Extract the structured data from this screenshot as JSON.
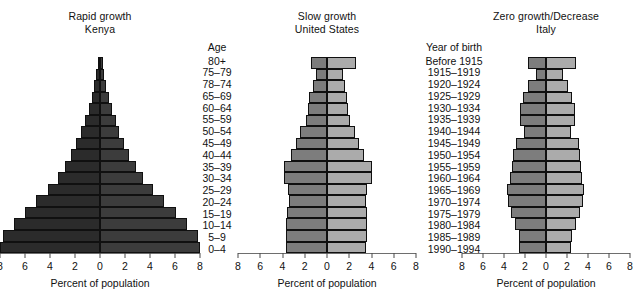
{
  "figure": {
    "axis_ticks": [
      "8",
      "6",
      "4",
      "2",
      "0",
      "2",
      "4",
      "6",
      "8"
    ],
    "axis_title": "Percent of population",
    "age_header": "Age",
    "yob_header": "Year of birth",
    "age_groups": [
      "80+",
      "75–79",
      "78–74",
      "65–69",
      "60–64",
      "55–59",
      "50–54",
      "45–49",
      "40–44",
      "35–39",
      "30–34",
      "25–29",
      "20–24",
      "15–19",
      "10–14",
      "5–9",
      "0–4"
    ],
    "years_of_birth": [
      "Before 1915",
      "1915–1919",
      "1920–1924",
      "1925–1929",
      "1930–1934",
      "1935–1939",
      "1940–1944",
      "1945–1949",
      "1950–1954",
      "1955–1959",
      "1960–1964",
      "1965–1969",
      "1970–1974",
      "1975–1979",
      "1980–1984",
      "1985–1989",
      "1990–1994"
    ],
    "colors": {
      "kenya_male": "#2b2b2b",
      "kenya_female": "#3c3c3c",
      "gray_male": "#7d7d7d",
      "gray_female": "#ababab",
      "outline": "#101010",
      "axis": "#6e6e6e",
      "text": "#111111",
      "background": "#ffffff"
    }
  },
  "chart_data": [
    {
      "id": "kenya",
      "type": "bar",
      "orientation": "population-pyramid",
      "title": "Rapid growth",
      "subtitle": "Kenya",
      "xlabel": "Percent of population",
      "ylabel": "Age",
      "xlim": [
        -8,
        8
      ],
      "xticks": [
        -8,
        -6,
        -4,
        -2,
        0,
        2,
        4,
        6,
        8
      ],
      "xticklabels": [
        "8",
        "6",
        "4",
        "2",
        "0",
        "2",
        "4",
        "6",
        "8"
      ],
      "grid": false,
      "legend": "none",
      "categories": [
        "80+",
        "75–79",
        "78–74",
        "65–69",
        "60–64",
        "55–59",
        "50–54",
        "45–49",
        "40–44",
        "35–39",
        "30–34",
        "25–29",
        "20–24",
        "15–19",
        "10–14",
        "5–9",
        "0–4"
      ],
      "series": [
        {
          "name": "Male",
          "side": "left",
          "color": "#2b2b2b",
          "values": [
            0.2,
            0.3,
            0.45,
            0.65,
            0.9,
            1.2,
            1.5,
            1.9,
            2.3,
            2.8,
            3.4,
            4.2,
            5.1,
            6.0,
            6.9,
            7.8,
            8.0
          ]
        },
        {
          "name": "Female",
          "side": "right",
          "color": "#3c3c3c",
          "values": [
            0.25,
            0.35,
            0.5,
            0.7,
            0.95,
            1.25,
            1.55,
            1.95,
            2.35,
            2.85,
            3.45,
            4.25,
            5.15,
            6.05,
            6.95,
            7.85,
            8.0
          ]
        }
      ]
    },
    {
      "id": "united-states",
      "type": "bar",
      "orientation": "population-pyramid",
      "title": "Slow growth",
      "subtitle": "United States",
      "xlabel": "Percent of population",
      "ylabel": "Year of birth",
      "xlim": [
        -8,
        8
      ],
      "xticks": [
        -8,
        -6,
        -4,
        -2,
        0,
        2,
        4,
        6,
        8
      ],
      "xticklabels": [
        "8",
        "6",
        "4",
        "2",
        "0",
        "2",
        "4",
        "6",
        "8"
      ],
      "grid": false,
      "legend": "none",
      "categories": [
        "Before 1915",
        "1915–1919",
        "1920–1924",
        "1925–1929",
        "1930–1934",
        "1935–1939",
        "1940–1944",
        "1945–1949",
        "1950–1954",
        "1955–1959",
        "1960–1964",
        "1965–1969",
        "1970–1974",
        "1975–1979",
        "1980–1984",
        "1985–1989",
        "1990–1994"
      ],
      "series": [
        {
          "name": "Male",
          "side": "left",
          "color": "#7d7d7d",
          "values": [
            1.4,
            1.0,
            1.3,
            1.6,
            1.7,
            1.9,
            2.4,
            2.8,
            3.2,
            3.9,
            3.9,
            3.5,
            3.4,
            3.6,
            3.7,
            3.7,
            3.7
          ]
        },
        {
          "name": "Female",
          "side": "right",
          "color": "#ababab",
          "values": [
            2.6,
            1.4,
            1.6,
            1.8,
            1.9,
            2.1,
            2.5,
            2.9,
            3.3,
            4.0,
            4.0,
            3.6,
            3.5,
            3.6,
            3.6,
            3.6,
            3.5
          ]
        }
      ]
    },
    {
      "id": "italy",
      "type": "bar",
      "orientation": "population-pyramid",
      "title": "Zero growth/Decrease",
      "subtitle": "Italy",
      "xlabel": "Percent of population",
      "ylabel": "Year of birth",
      "xlim": [
        -8,
        8
      ],
      "xticks": [
        -8,
        -6,
        -4,
        -2,
        0,
        2,
        4,
        6,
        8
      ],
      "xticklabels": [
        "8",
        "6",
        "4",
        "2",
        "0",
        "2",
        "4",
        "6",
        "8"
      ],
      "grid": false,
      "legend": "none",
      "categories": [
        "Before 1915",
        "1915–1919",
        "1920–1924",
        "1925–1929",
        "1930–1934",
        "1935–1939",
        "1940–1944",
        "1945–1949",
        "1950–1954",
        "1955–1959",
        "1960–1964",
        "1965–1969",
        "1970–1974",
        "1975–1979",
        "1980–1984",
        "1985–1989",
        "1990–1994"
      ],
      "series": [
        {
          "name": "Male",
          "side": "left",
          "color": "#7d7d7d",
          "values": [
            1.7,
            1.0,
            1.7,
            2.2,
            2.5,
            2.5,
            2.1,
            2.9,
            3.1,
            3.2,
            3.4,
            3.7,
            3.6,
            3.3,
            3.0,
            2.6,
            2.6
          ]
        },
        {
          "name": "Female",
          "side": "right",
          "color": "#ababab",
          "values": [
            2.9,
            1.6,
            2.1,
            2.5,
            2.8,
            2.8,
            2.4,
            3.1,
            3.2,
            3.3,
            3.4,
            3.6,
            3.5,
            3.2,
            2.9,
            2.5,
            2.4
          ]
        }
      ]
    }
  ]
}
